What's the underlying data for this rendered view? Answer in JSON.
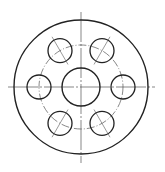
{
  "diagram": {
    "type": "flange-drawing",
    "view": "front",
    "width": 165,
    "height": 172,
    "center": [
      81,
      87
    ],
    "stroke_color": "#222222",
    "thin_color": "#555555",
    "outer_circle": {
      "r": 67
    },
    "center_hole": {
      "r": 19
    },
    "bolt_circle": {
      "r": 42,
      "style": "dash-dot"
    },
    "bolt_holes": {
      "count": 6,
      "r": 12,
      "angles_deg": [
        0,
        60,
        120,
        180,
        240,
        300
      ]
    },
    "centerlines": {
      "horizontal": [
        8,
        155
      ],
      "vertical": [
        12,
        163
      ]
    }
  }
}
